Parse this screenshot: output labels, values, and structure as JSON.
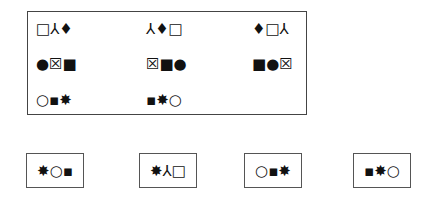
{
  "puzzle": {
    "grid": [
      [
        "□⅄♦",
        "⅄♦□",
        "♦□⅄"
      ],
      [
        "●☒■",
        "☒■●",
        "■●☒"
      ],
      [
        "○▪✸",
        "▪✸○",
        ""
      ]
    ],
    "options": [
      "✸○▪",
      "✸⅄□",
      "○▪✸",
      "▪✸○"
    ]
  }
}
